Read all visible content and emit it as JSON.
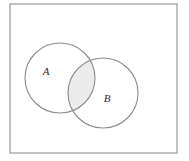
{
  "figure": {
    "type": "venn-diagram",
    "background_color": "#ffffff",
    "universe": {
      "label": "",
      "border_color": "#9a9a9a",
      "fill_color": "#ffffff",
      "x": 10,
      "y": 4,
      "width": 167,
      "height": 149,
      "stroke_width": 1.2
    },
    "sets": [
      {
        "id": "A",
        "label": "A",
        "cx": 60,
        "cy": 78,
        "r": 35,
        "stroke_color": "#8c8c8c",
        "fill_color": "none",
        "stroke_width": 1.1,
        "label_x": 46,
        "label_y": 75
      },
      {
        "id": "B",
        "label": "B",
        "cx": 103,
        "cy": 93,
        "r": 35,
        "stroke_color": "#8c8c8c",
        "fill_color": "none",
        "stroke_width": 1.1,
        "label_x": 107,
        "label_y": 102
      }
    ],
    "intersection": {
      "name": "A-intersect-B",
      "shaded": true,
      "fill_color": "#ececec",
      "stroke_color": "#8c8c8c"
    }
  }
}
